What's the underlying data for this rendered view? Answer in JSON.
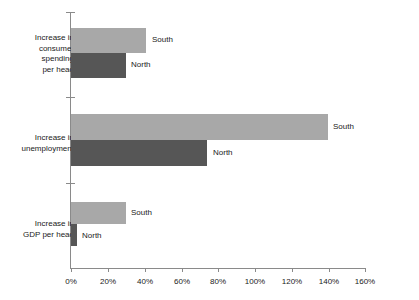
{
  "chart_data": {
    "type": "bar",
    "orientation": "horizontal",
    "title": "",
    "xlabel": "",
    "ylabel": "",
    "xlim": [
      0,
      160
    ],
    "xtick_labels": [
      "0%",
      "20%",
      "40%",
      "60%",
      "80%",
      "100%",
      "120%",
      "140%",
      "160%"
    ],
    "xtick_values": [
      0,
      20,
      40,
      60,
      80,
      100,
      120,
      140,
      160
    ],
    "grid": false,
    "legend_position": "inline-data-labels",
    "categories": [
      "Increase in\nconsumer\nspending\nper head",
      "Increase in\nunemployment",
      "Increase in\nGDP per head"
    ],
    "series": [
      {
        "name": "South",
        "color": "#a8a8a8",
        "values": [
          41,
          140,
          30
        ]
      },
      {
        "name": "North",
        "color": "#565656",
        "values": [
          30,
          74,
          3
        ]
      }
    ],
    "bars": [
      {
        "category": "Increase in consumer spending per head",
        "series": "South",
        "value": 41,
        "label": "South"
      },
      {
        "category": "Increase in consumer spending per head",
        "series": "North",
        "value": 30,
        "label": "North"
      },
      {
        "category": "Increase in unemployment",
        "series": "South",
        "value": 140,
        "label": "South"
      },
      {
        "category": "Increase in unemployment",
        "series": "North",
        "value": 74,
        "label": "North"
      },
      {
        "category": "Increase in GDP per head",
        "series": "South",
        "value": 30,
        "label": "South"
      },
      {
        "category": "Increase in GDP per head",
        "series": "North",
        "value": 3,
        "label": "North"
      }
    ]
  },
  "axis": {
    "ticks": [
      {
        "label": "0%",
        "value": 0
      },
      {
        "label": "20%",
        "value": 20
      },
      {
        "label": "40%",
        "value": 40
      },
      {
        "label": "60%",
        "value": 60
      },
      {
        "label": "80%",
        "value": 80
      },
      {
        "label": "100%",
        "value": 100
      },
      {
        "label": "120%",
        "value": 120
      },
      {
        "label": "140%",
        "value": 140
      },
      {
        "label": "160%",
        "value": 160
      }
    ]
  },
  "colors": {
    "south": "#a8a8a8",
    "north": "#565656",
    "axis": "#8a8a8a",
    "text": "#1a1a1a",
    "background": "#ffffff"
  }
}
